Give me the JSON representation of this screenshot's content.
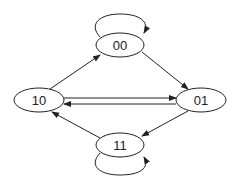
{
  "diagram": {
    "type": "state-transition",
    "nodes": [
      {
        "id": "00",
        "label": "00"
      },
      {
        "id": "01",
        "label": "01"
      },
      {
        "id": "10",
        "label": "10"
      },
      {
        "id": "11",
        "label": "11"
      }
    ],
    "edges": [
      {
        "from": "00",
        "to": "00"
      },
      {
        "from": "10",
        "to": "00"
      },
      {
        "from": "00",
        "to": "01"
      },
      {
        "from": "10",
        "to": "01"
      },
      {
        "from": "01",
        "to": "10"
      },
      {
        "from": "01",
        "to": "11"
      },
      {
        "from": "11",
        "to": "10"
      },
      {
        "from": "11",
        "to": "11"
      }
    ],
    "colors": {
      "stroke": "#222222",
      "background": "#ffffff"
    }
  }
}
